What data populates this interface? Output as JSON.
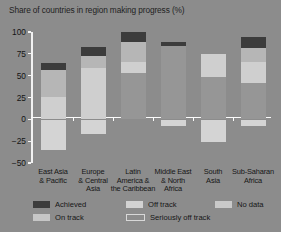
{
  "chart_data": {
    "type": "bar",
    "stacked": true,
    "title": "Share of countries in region making progress (%)",
    "xlabel": "",
    "ylabel": "",
    "ylim": [
      -50,
      100
    ],
    "yticks": [
      100,
      75,
      50,
      25,
      0,
      -25,
      -50
    ],
    "ytick_labels": [
      "100",
      "75",
      "50",
      "25",
      "0",
      "−25",
      "−50"
    ],
    "grid": false,
    "legend_position": "bottom",
    "categories": [
      "East Asia & Pacific",
      "Europe & Central Asia",
      "Latin America & the Caribbean",
      "Middle East & North Africa",
      "South Asia",
      "Sub-Saharan Africa"
    ],
    "category_lines": [
      [
        "East Asia",
        "& Pacific"
      ],
      [
        "Europe",
        "& Central",
        "Asia"
      ],
      [
        "Latin",
        "America &",
        "the Caribbean"
      ],
      [
        "Middle East",
        "& North",
        "Africa"
      ],
      [
        "South",
        "Asia"
      ],
      [
        "Sub-Saharan",
        "Africa"
      ]
    ],
    "series": [
      {
        "name": "Achieved",
        "key": "achieved",
        "color": "#3c3c3c",
        "values": [
          9,
          11,
          12,
          5,
          0,
          12
        ]
      },
      {
        "name": "On track",
        "key": "ontrack",
        "color": "#b6b6b6",
        "values": [
          30,
          13,
          22,
          0,
          0,
          16
        ]
      },
      {
        "name": "Off track",
        "key": "offtrack",
        "color": "#cfcfcf",
        "values": [
          26,
          59,
          13,
          0,
          26,
          24
        ]
      },
      {
        "name": "Seriously off track",
        "key": "seriously",
        "color": "#969696",
        "values": [
          0,
          0,
          53,
          84,
          49,
          42
        ]
      },
      {
        "name": "No data",
        "key": "nodata",
        "color": "#d4d4d4",
        "values": [
          -34,
          -16,
          0,
          -7,
          -25,
          -7
        ]
      }
    ],
    "totals_positive": [
      65,
      83,
      100,
      89,
      75,
      94
    ]
  },
  "legend": {
    "items": [
      {
        "label": "Achieved"
      },
      {
        "label": "On track"
      },
      {
        "label": "Off track"
      },
      {
        "label": "Seriously off track"
      },
      {
        "label": "No data"
      }
    ]
  },
  "colors": {
    "background": "#8c8c8c",
    "axis": "#f2f2f2",
    "text": "#161616"
  }
}
